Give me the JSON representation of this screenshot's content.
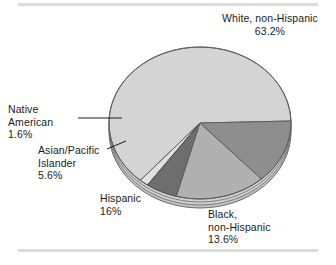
{
  "figure": {
    "background_color": "#ffffff",
    "rule_color": "#dcdcdc"
  },
  "chart_data": {
    "type": "pie",
    "title": "",
    "subtitle": "",
    "xlabel": "",
    "ylabel": "",
    "legend_position": "callout-labels",
    "grid": false,
    "style": "3d-pie-grayscale",
    "categories": [
      "White, non-Hispanic",
      "Black, non-Hispanic",
      "Hispanic",
      "Asian/Pacific Islander",
      "Native American"
    ],
    "values": [
      63.2,
      13.6,
      16,
      5.6,
      1.6
    ],
    "value_labels": [
      "63.2%",
      "13.6%",
      "16%",
      "5.6%",
      "1.6%"
    ],
    "colors": [
      "#d4d4d4",
      "#8e8e8e",
      "#b0b0b0",
      "#6e6e6e",
      "#e0e0e0"
    ],
    "slices": [
      {
        "name": "White, non-Hispanic",
        "value": 63.2,
        "value_label": "63.2%",
        "color": "#d4d4d4",
        "label_lines": [
          "White, non-Hispanic"
        ]
      },
      {
        "name": "Black, non-Hispanic",
        "value": 13.6,
        "value_label": "13.6%",
        "color": "#8e8e8e",
        "label_lines": [
          "Black,",
          "non-Hispanic"
        ]
      },
      {
        "name": "Hispanic",
        "value": 16,
        "value_label": "16%",
        "color": "#b0b0b0",
        "label_lines": [
          "Hispanic"
        ]
      },
      {
        "name": "Asian/Pacific Islander",
        "value": 5.6,
        "value_label": "5.6%",
        "color": "#6e6e6e",
        "label_lines": [
          "Asian/Pacific",
          "Islander"
        ]
      },
      {
        "name": "Native American",
        "value": 1.6,
        "value_label": "1.6%",
        "color": "#e0e0e0",
        "label_lines": [
          "Native",
          "American"
        ]
      }
    ]
  },
  "labels": {
    "white": {
      "line1": "White, non-Hispanic",
      "pct": "63.2%"
    },
    "native": {
      "line1": "Native",
      "line2": "American",
      "pct": "1.6%"
    },
    "asian": {
      "line1": "Asian/Pacific",
      "line2": "Islander",
      "pct": "5.6%"
    },
    "hispanic": {
      "line1": "Hispanic",
      "pct": "16%"
    },
    "black": {
      "line1": "Black,",
      "line2": "non-Hispanic",
      "pct": "13.6%"
    }
  }
}
